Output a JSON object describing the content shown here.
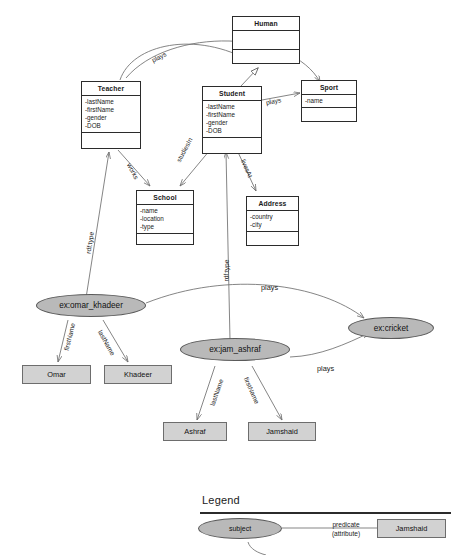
{
  "diagram": {
    "colors": {
      "subject_fill": "#b9b9b9",
      "literal_fill": "#d2d2d2",
      "stroke": "#2b2b2b",
      "edge": "#6f6f6f"
    }
  },
  "classes": [
    {
      "id": "human",
      "name": "Human",
      "attributes": [],
      "operations": []
    },
    {
      "id": "teacher",
      "name": "Teacher",
      "attributes": [
        "-lastName",
        "-firstName",
        "-gender",
        "-DOB"
      ],
      "operations": []
    },
    {
      "id": "student",
      "name": "Student",
      "attributes": [
        "-lastName",
        "-firstName",
        "-gender",
        "-DOB"
      ],
      "operations": []
    },
    {
      "id": "sport",
      "name": "Sport",
      "attributes": [
        "-name"
      ],
      "operations": []
    },
    {
      "id": "school",
      "name": "School",
      "attributes": [
        "-name",
        "-location",
        "-type"
      ],
      "operations": []
    },
    {
      "id": "address",
      "name": "Address",
      "attributes": [
        "-country",
        "-city"
      ],
      "operations": []
    }
  ],
  "class_edges": [
    {
      "id": "teacher-human",
      "label": "",
      "kind": "generalization"
    },
    {
      "id": "student-human",
      "label": "",
      "kind": "generalization"
    },
    {
      "id": "teacher-sport",
      "label": "plays",
      "kind": "association"
    },
    {
      "id": "student-sport",
      "label": "plays",
      "kind": "association"
    },
    {
      "id": "teacher-school",
      "label": "works",
      "kind": "association"
    },
    {
      "id": "student-school",
      "label": "studiesIn",
      "kind": "association"
    },
    {
      "id": "student-address",
      "label": "livesAt",
      "kind": "association"
    }
  ],
  "instances": [
    {
      "id": "omar",
      "label": "ex:omar_khadeer",
      "type": "subject"
    },
    {
      "id": "jam",
      "label": "ex:jam_ashraf",
      "type": "subject"
    },
    {
      "id": "cricket",
      "label": "ex:cricket",
      "type": "subject"
    }
  ],
  "literals": [
    {
      "id": "omar-first",
      "label": "Omar"
    },
    {
      "id": "omar-last",
      "label": "Khadeer"
    },
    {
      "id": "jam-last",
      "label": "Ashraf"
    },
    {
      "id": "jam-first",
      "label": "Jamshaid"
    }
  ],
  "rdf_edges": [
    {
      "id": "omar-type",
      "label": "rdf:type",
      "from": "ex:omar_khadeer",
      "to": "Teacher"
    },
    {
      "id": "jam-type",
      "label": "rdf:type",
      "from": "ex:jam_ashraf",
      "to": "Student"
    },
    {
      "id": "omar-firstname",
      "label": "firstName",
      "from": "ex:omar_khadeer",
      "to": "Omar"
    },
    {
      "id": "omar-lastname",
      "label": "lastName",
      "from": "ex:omar_khadeer",
      "to": "Khadeer"
    },
    {
      "id": "jam-lastname",
      "label": "lastName",
      "from": "ex:jam_ashraf",
      "to": "Ashraf"
    },
    {
      "id": "jam-firstname",
      "label": "firstName",
      "from": "ex:jam_ashraf",
      "to": "Jamshaid"
    },
    {
      "id": "omar-plays",
      "label": "plays",
      "from": "ex:omar_khadeer",
      "to": "ex:cricket"
    },
    {
      "id": "jam-plays",
      "label": "plays",
      "from": "ex:jam_ashraf",
      "to": "ex:cricket"
    }
  ],
  "legend": {
    "title": "Legend",
    "subject_label": "subject",
    "predicate_line1": "predicate",
    "predicate_line2": "(attribute)",
    "object_label": "Jamshaid"
  }
}
